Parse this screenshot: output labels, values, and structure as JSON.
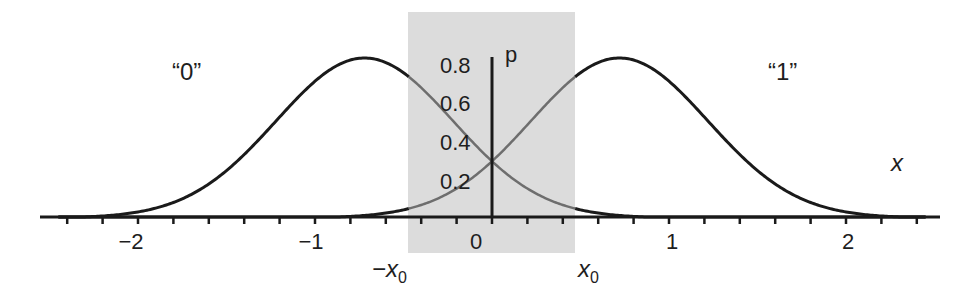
{
  "chart_data": {
    "type": "line",
    "title": "",
    "xlabel": "x",
    "ylabel": "p",
    "xlim": [
      -2.5,
      2.5
    ],
    "ylim": [
      0,
      0.8
    ],
    "x_ticks": [
      "-2",
      "-1",
      "0",
      "1",
      "2"
    ],
    "y_ticks": [
      "0.2",
      "0.4",
      "0.6",
      "0.8"
    ],
    "minor_tick_step": 0.2,
    "grid": false,
    "series": [
      {
        "name": "“0”",
        "mean": -0.72,
        "sigma": 0.5,
        "peak": 0.8,
        "x": [
          -2.4,
          -2.0,
          -1.6,
          -1.2,
          -0.72,
          -0.4,
          0.0,
          0.4,
          0.8,
          1.2
        ],
        "values": [
          0.01,
          0.03,
          0.13,
          0.5,
          0.8,
          0.65,
          0.28,
          0.06,
          0.01,
          0.0
        ]
      },
      {
        "name": "“1”",
        "mean": 0.72,
        "sigma": 0.5,
        "peak": 0.8,
        "x": [
          -1.2,
          -0.8,
          -0.4,
          0.0,
          0.4,
          0.72,
          1.2,
          1.6,
          2.0,
          2.4
        ],
        "values": [
          0.0,
          0.01,
          0.06,
          0.28,
          0.65,
          0.8,
          0.5,
          0.13,
          0.03,
          0.01
        ]
      }
    ],
    "annotations": {
      "shaded_region": {
        "from": "-x0",
        "to": "x0",
        "x0": 0.47,
        "color": "#d9d9d9"
      },
      "label_zero_class": "“0”",
      "label_one_class": "“1”",
      "neg_threshold": "−x",
      "pos_threshold": "x",
      "threshold_subscript": "0",
      "crossing_value": 0.3
    }
  },
  "labels": {
    "class0": "“0”",
    "class1": "“1”",
    "x_axis": "x",
    "y_axis": "p",
    "neg_x0_main": "−x",
    "pos_x0_main": "x",
    "sub0": "0",
    "xt_m2": "−2",
    "xt_m1": "−1",
    "xt_0": "0",
    "xt_1": "1",
    "xt_2": "2",
    "yt_02": "0.2",
    "yt_04": "0.4",
    "yt_06": "0.6",
    "yt_08": "0.8"
  },
  "colors": {
    "curve": "#1a1a1a",
    "curve_in_shade": "#6e6e6e",
    "shade": "#d9d9d9",
    "axis": "#1a1a1a"
  }
}
